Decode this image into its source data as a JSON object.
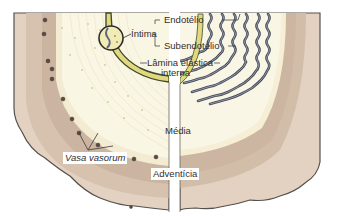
{
  "diagram": {
    "labels": {
      "intima": "Íntima",
      "endothelium": "Endotélio",
      "subendothelium": "Subendotélio",
      "internal_elastic_lamina_line1": "Lâmina elástica",
      "internal_elastic_lamina_line2": "interna",
      "media": "Média",
      "adventitia": "Adventícia",
      "vasa_vasorum": "Vasa vasorum"
    },
    "layers": [
      {
        "name": "Íntima",
        "color": "#d9cf6a"
      },
      {
        "name": "Média",
        "color": "#f7f2dc"
      },
      {
        "name": "Adventícia",
        "color": "#d7c6b4"
      }
    ],
    "colors": {
      "adventitia_outer": "#e6d6c7",
      "adventitia_inner": "#cdb9a6",
      "media_fill": "#f9f4df",
      "intima_fill": "#e4dc86",
      "elastic_lamina": "#4a4f5c",
      "elastic_lamina_highlight": "#9aa3b5",
      "outline": "#55504c",
      "vessel_dot": "#5a4a42"
    }
  }
}
